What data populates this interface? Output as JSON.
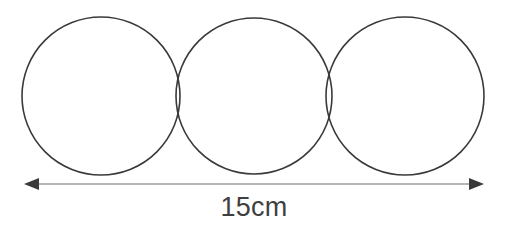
{
  "figure": {
    "background_color": "#ffffff",
    "width": 507,
    "height": 227
  },
  "diagram": {
    "shape_type": "circle",
    "shape_count": 3,
    "stroke_color": "#3a3a3a",
    "stroke_width": 1.6,
    "fill": "none",
    "circles": [
      {
        "name": "circle-left",
        "cx": 101,
        "cy": 96,
        "r": 79
      },
      {
        "name": "circle-middle",
        "cx": 254,
        "cy": 96,
        "r": 78
      },
      {
        "name": "circle-right",
        "cx": 405,
        "cy": 96,
        "r": 79
      }
    ]
  },
  "dimension": {
    "label": "15cm",
    "value": 15,
    "unit": "cm",
    "label_color": "#3f3f3f",
    "line_color": "#9c9c9c",
    "arrowhead_color": "#3a3a3a",
    "line_y": 184,
    "x_start": 24,
    "x_end": 484,
    "label_x": 254,
    "label_y": 216
  },
  "chart_data": {
    "type": "diagram",
    "annotations": [
      "15cm"
    ],
    "shapes": [
      {
        "type": "circle",
        "label": "circle 1",
        "cx": 101,
        "cy": 96,
        "r": 79
      },
      {
        "type": "circle",
        "label": "circle 2",
        "cx": 254,
        "cy": 96,
        "r": 78
      },
      {
        "type": "circle",
        "label": "circle 3",
        "cx": 405,
        "cy": 96,
        "r": 79
      }
    ],
    "measurements": [
      {
        "label": "15cm",
        "value": 15,
        "unit": "cm",
        "from_x": 24,
        "to_x": 484,
        "axis": "horizontal"
      }
    ]
  }
}
